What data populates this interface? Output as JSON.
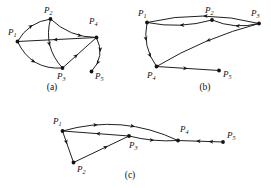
{
  "figure": {
    "background_color": "#ffffff",
    "ink_color": "#141414",
    "panels": [
      {
        "id": "a",
        "caption": "(a)",
        "caption_pos": {
          "x": 52,
          "y": 90
        },
        "nodes": [
          {
            "id": "P1",
            "label": "P",
            "sub": "1",
            "x": 17.5,
            "y": 41.5,
            "label_x": 8,
            "label_y": 35
          },
          {
            "id": "P2",
            "label": "P",
            "sub": "2",
            "x": 50.5,
            "y": 19.0,
            "label_x": 44,
            "label_y": 13
          },
          {
            "id": "P3",
            "label": "P",
            "sub": "3",
            "x": 62.5,
            "y": 68.0,
            "label_x": 57,
            "label_y": 79
          },
          {
            "id": "P4",
            "label": "P",
            "sub": "4",
            "x": 96.5,
            "y": 37.5,
            "label_x": 89,
            "label_y": 24
          },
          {
            "id": "P5",
            "label": "P",
            "sub": "5",
            "x": 91.5,
            "y": 71.5,
            "label_x": 95,
            "label_y": 79
          }
        ],
        "edges": [
          {
            "from": "P1",
            "to": "P2",
            "curve": -5,
            "arrows": [
              0.55
            ]
          },
          {
            "from": "P2",
            "to": "P3",
            "curve": 7,
            "arrows": [
              0.52
            ]
          },
          {
            "from": "P1",
            "to": "P3",
            "curve": 9,
            "arrows": [
              0.5
            ]
          },
          {
            "from": "P4",
            "to": "P1",
            "curve": 0,
            "arrows": [
              0.55
            ]
          },
          {
            "from": "P3",
            "to": "P4",
            "curve": 0,
            "arrows": [
              0.45
            ]
          },
          {
            "from": "P2",
            "to": "P4",
            "curve": 5,
            "arrows": [
              0.72
            ]
          },
          {
            "from": "P4",
            "to": "P5",
            "curve": -6,
            "arrows": [
              0.4,
              0.78
            ]
          }
        ]
      },
      {
        "id": "b",
        "caption": "(b)",
        "caption_pos": {
          "x": 205,
          "y": 90
        },
        "nodes": [
          {
            "id": "P1",
            "label": "P",
            "sub": "1",
            "x": 147.0,
            "y": 22.5,
            "label_x": 138,
            "label_y": 16
          },
          {
            "id": "P2",
            "label": "P",
            "sub": "2",
            "x": 212.0,
            "y": 20.0,
            "label_x": 205,
            "label_y": 13
          },
          {
            "id": "P3",
            "label": "P",
            "sub": "3",
            "x": 259.0,
            "y": 23.5,
            "label_x": 251,
            "label_y": 16
          },
          {
            "id": "P4",
            "label": "P",
            "sub": "4",
            "x": 156.5,
            "y": 66.5,
            "label_x": 147,
            "label_y": 78
          },
          {
            "id": "P5",
            "label": "P",
            "sub": "5",
            "x": 219.0,
            "y": 70.5,
            "label_x": 223,
            "label_y": 77
          }
        ],
        "edges": [
          {
            "from": "P2",
            "to": "P1",
            "curve": -4,
            "arrows": [
              0.5
            ]
          },
          {
            "from": "P3",
            "to": "P2",
            "curve": -4,
            "arrows": [
              0.5
            ]
          },
          {
            "from": "P3",
            "to": "P1",
            "curve": 7,
            "arrows": [
              0.5
            ]
          },
          {
            "from": "P1",
            "to": "P4",
            "curve": 5,
            "arrows": [
              0.4,
              0.78
            ]
          },
          {
            "from": "P3",
            "to": "P4",
            "curve": 4,
            "arrows": [
              0.5
            ]
          },
          {
            "from": "P4",
            "to": "P5",
            "curve": 0,
            "arrows": [
              0.5
            ]
          }
        ]
      },
      {
        "id": "c",
        "caption": "(c)",
        "caption_pos": {
          "x": 130,
          "y": 178
        },
        "nodes": [
          {
            "id": "P1",
            "label": "P",
            "sub": "1",
            "x": 62.5,
            "y": 131.0,
            "label_x": 53,
            "label_y": 124
          },
          {
            "id": "P2",
            "label": "P",
            "sub": "2",
            "x": 73.5,
            "y": 162.5,
            "label_x": 77,
            "label_y": 172
          },
          {
            "id": "P3",
            "label": "P",
            "sub": "3",
            "x": 129.0,
            "y": 136.0,
            "label_x": 129,
            "label_y": 148
          },
          {
            "id": "P4",
            "label": "P",
            "sub": "4",
            "x": 178.0,
            "y": 140.5,
            "label_x": 180,
            "label_y": 132
          },
          {
            "id": "P5",
            "label": "P",
            "sub": "5",
            "x": 223.0,
            "y": 142.0,
            "label_x": 227,
            "label_y": 138
          }
        ],
        "edges": [
          {
            "from": "P1",
            "to": "P4",
            "curve": -11,
            "arrows": [
              0.3,
              0.62
            ]
          },
          {
            "from": "P3",
            "to": "P1",
            "curve": 0,
            "arrows": [
              0.5
            ]
          },
          {
            "from": "P1",
            "to": "P2",
            "curve": 0,
            "arrows": [
              0.42
            ]
          },
          {
            "from": "P2",
            "to": "P3",
            "curve": 0,
            "arrows": [
              0.62
            ]
          },
          {
            "from": "P3",
            "to": "P4",
            "curve": 2,
            "arrows": [
              0.52
            ]
          },
          {
            "from": "P5",
            "to": "P4",
            "curve": 0,
            "arrows": [
              0.32,
              0.6
            ]
          }
        ]
      }
    ]
  }
}
